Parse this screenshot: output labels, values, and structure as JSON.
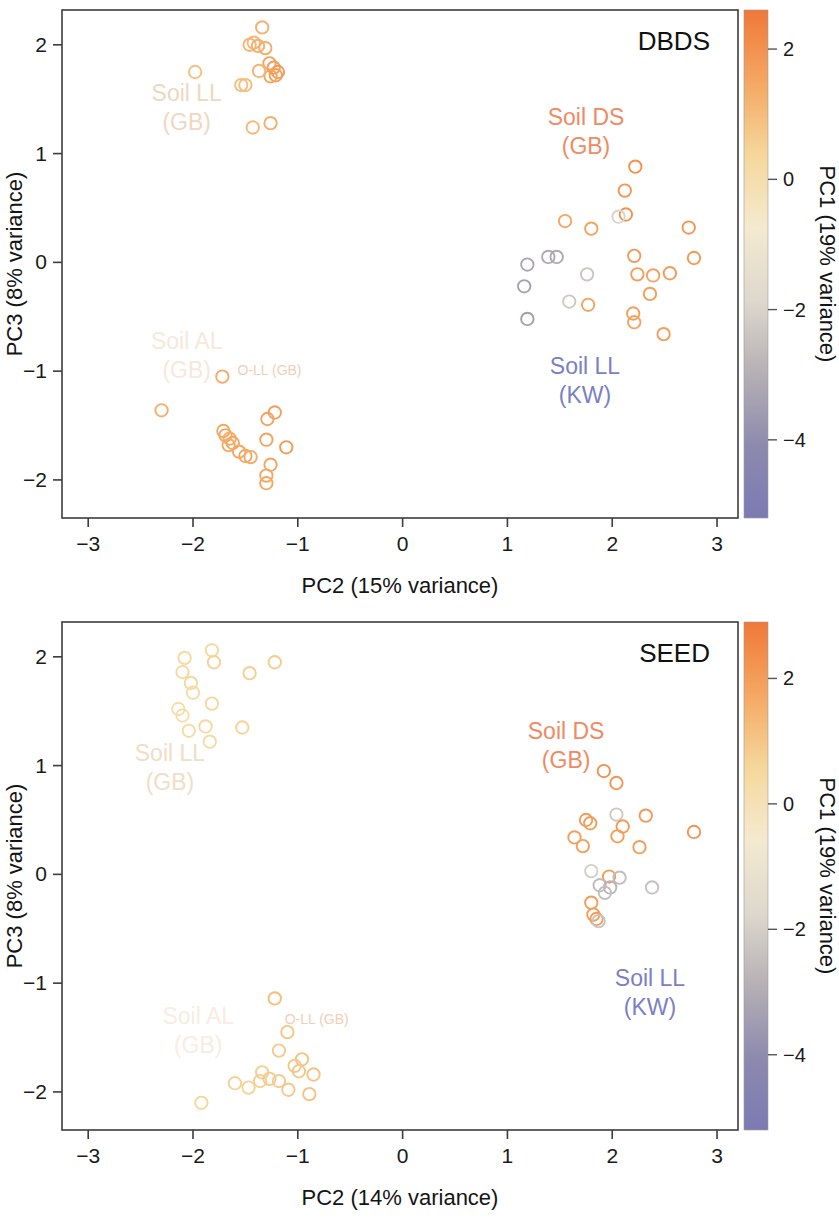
{
  "figure": {
    "kind": "pca-scatter-two-panel",
    "panels": [
      "DBDS",
      "SEED"
    ]
  },
  "panels": [
    {
      "id": "dbds",
      "title": "DBDS",
      "xlabel": "PC2 (15% variance)",
      "ylabel": "PC3 (8% variance)",
      "colorbar_label": "PC1 (19% variance)",
      "annotations": [
        {
          "name": "soil-ll-gb",
          "lines": [
            "Soil LL",
            "(GB)"
          ],
          "x": -2.06,
          "y": 1.48,
          "color": "#f0d7bf",
          "size": "normal"
        },
        {
          "name": "soil-al-gb",
          "lines": [
            "Soil AL",
            "(GB)"
          ],
          "x": -2.06,
          "y": -0.8,
          "color": "#f7e8da",
          "size": "normal"
        },
        {
          "name": "o-ll-gb",
          "lines": [
            "O-LL (GB)"
          ],
          "x": -1.27,
          "y": -1.04,
          "color": "#f3cdb6",
          "size": "small"
        },
        {
          "name": "soil-ds-gb",
          "lines": [
            "Soil DS",
            "(GB)"
          ],
          "x": 1.75,
          "y": 1.26,
          "color": "#f08a62",
          "size": "normal"
        },
        {
          "name": "soil-ll-kw",
          "lines": [
            "Soil LL",
            "(KW)"
          ],
          "x": 1.74,
          "y": -1.03,
          "color": "#7b7fc4",
          "size": "normal"
        }
      ]
    },
    {
      "id": "seed",
      "title": "SEED",
      "xlabel": "PC2 (14% variance)",
      "ylabel": "PC3 (8% variance)",
      "colorbar_label": "PC1 (19% variance)",
      "annotations": [
        {
          "name": "soil-ll-gb",
          "lines": [
            "Soil LL",
            "(GB)"
          ],
          "x": -2.22,
          "y": 1.04,
          "color": "#f2ddc6",
          "size": "normal"
        },
        {
          "name": "soil-al-gb",
          "lines": [
            "Soil AL",
            "(GB)"
          ],
          "x": -1.95,
          "y": -1.38,
          "color": "#f9ece0",
          "size": "normal"
        },
        {
          "name": "o-ll-gb",
          "lines": [
            "O-LL (GB)"
          ],
          "x": -0.82,
          "y": -1.38,
          "color": "#f3cdb6",
          "size": "small"
        },
        {
          "name": "soil-ds-gb",
          "lines": [
            "Soil DS",
            "(GB)"
          ],
          "x": 1.56,
          "y": 1.24,
          "color": "#f08a62",
          "size": "normal"
        },
        {
          "name": "soil-ll-kw",
          "lines": [
            "Soil LL",
            "(KW)"
          ],
          "x": 2.36,
          "y": -1.03,
          "color": "#7b7fc4",
          "size": "normal"
        }
      ]
    }
  ],
  "chart_data": [
    {
      "type": "scatter",
      "title": "DBDS",
      "xlabel": "PC2 (15% variance)",
      "ylabel": "PC3 (8% variance)",
      "xlim": [
        -3.25,
        3.2
      ],
      "ylim": [
        -2.35,
        2.32
      ],
      "xticks": [
        -3,
        -2,
        -1,
        0,
        1,
        2,
        3
      ],
      "yticks": [
        -2,
        -1,
        0,
        1,
        2
      ],
      "grid": false,
      "marker": "open-circle",
      "colorbar": {
        "label": "PC1 (19% variance)",
        "ticks": [
          2,
          0,
          -2,
          -4
        ],
        "vmin": -5.2,
        "vmax": 2.6,
        "colors": [
          "#f07838",
          "#f4a863",
          "#f6d79b",
          "#f4ead0",
          "#ded8cd",
          "#b6b0b5",
          "#8d8aae",
          "#7b7ab4"
        ]
      },
      "points": [
        {
          "x": -1.34,
          "y": 2.16,
          "c": 1.3
        },
        {
          "x": -1.42,
          "y": 2.02,
          "c": 1.1
        },
        {
          "x": -1.46,
          "y": 2.0,
          "c": 1.2
        },
        {
          "x": -1.38,
          "y": 1.99,
          "c": 1.3
        },
        {
          "x": -1.31,
          "y": 1.97,
          "c": 1.4
        },
        {
          "x": -1.27,
          "y": 1.83,
          "c": 1.6
        },
        {
          "x": -1.23,
          "y": 1.79,
          "c": 1.7
        },
        {
          "x": -1.19,
          "y": 1.75,
          "c": 1.8
        },
        {
          "x": -1.21,
          "y": 1.72,
          "c": 1.7
        },
        {
          "x": -1.26,
          "y": 1.71,
          "c": 1.5
        },
        {
          "x": -1.37,
          "y": 1.76,
          "c": 1.2
        },
        {
          "x": -1.98,
          "y": 1.75,
          "c": 0.9
        },
        {
          "x": -1.54,
          "y": 1.63,
          "c": 1.0
        },
        {
          "x": -1.5,
          "y": 1.63,
          "c": 1.0
        },
        {
          "x": -1.43,
          "y": 1.24,
          "c": 1.1
        },
        {
          "x": -1.26,
          "y": 1.28,
          "c": 1.3
        },
        {
          "x": -1.72,
          "y": -1.05,
          "c": 1.4
        },
        {
          "x": -2.3,
          "y": -1.36,
          "c": 1.3
        },
        {
          "x": -1.71,
          "y": -1.55,
          "c": 1.5
        },
        {
          "x": -1.69,
          "y": -1.59,
          "c": 1.5
        },
        {
          "x": -1.65,
          "y": -1.62,
          "c": 1.4
        },
        {
          "x": -1.62,
          "y": -1.66,
          "c": 1.5
        },
        {
          "x": -1.66,
          "y": -1.68,
          "c": 1.4
        },
        {
          "x": -1.56,
          "y": -1.74,
          "c": 1.5
        },
        {
          "x": -1.5,
          "y": -1.78,
          "c": 1.5
        },
        {
          "x": -1.45,
          "y": -1.79,
          "c": 1.4
        },
        {
          "x": -1.29,
          "y": -1.44,
          "c": 1.6
        },
        {
          "x": -1.22,
          "y": -1.38,
          "c": 1.7
        },
        {
          "x": -1.3,
          "y": -1.63,
          "c": 1.6
        },
        {
          "x": -1.11,
          "y": -1.7,
          "c": 1.8
        },
        {
          "x": -1.26,
          "y": -1.86,
          "c": 1.6
        },
        {
          "x": -1.3,
          "y": -1.96,
          "c": 1.5
        },
        {
          "x": -1.3,
          "y": -2.03,
          "c": 1.5
        },
        {
          "x": 2.22,
          "y": 0.88,
          "c": 2.0
        },
        {
          "x": 2.12,
          "y": 0.66,
          "c": 1.9
        },
        {
          "x": 2.13,
          "y": 0.44,
          "c": 2.0
        },
        {
          "x": 2.06,
          "y": 0.42,
          "c": -2.0
        },
        {
          "x": 1.55,
          "y": 0.38,
          "c": 1.5
        },
        {
          "x": 1.8,
          "y": 0.31,
          "c": 1.6
        },
        {
          "x": 2.73,
          "y": 0.32,
          "c": 1.9
        },
        {
          "x": 1.19,
          "y": -0.02,
          "c": -3.3
        },
        {
          "x": 1.39,
          "y": 0.05,
          "c": -3.2
        },
        {
          "x": 1.47,
          "y": 0.05,
          "c": -3.2
        },
        {
          "x": 2.21,
          "y": 0.06,
          "c": 1.8
        },
        {
          "x": 2.78,
          "y": 0.04,
          "c": 1.8
        },
        {
          "x": 1.16,
          "y": -0.22,
          "c": -3.4
        },
        {
          "x": 1.76,
          "y": -0.11,
          "c": -2.4
        },
        {
          "x": 2.24,
          "y": -0.11,
          "c": 1.7
        },
        {
          "x": 2.39,
          "y": -0.12,
          "c": 1.6
        },
        {
          "x": 2.55,
          "y": -0.1,
          "c": 1.8
        },
        {
          "x": 1.59,
          "y": -0.36,
          "c": -2.3
        },
        {
          "x": 1.77,
          "y": -0.39,
          "c": 1.6
        },
        {
          "x": 2.36,
          "y": -0.29,
          "c": 1.7
        },
        {
          "x": 1.19,
          "y": -0.52,
          "c": -3.5
        },
        {
          "x": 2.2,
          "y": -0.47,
          "c": 1.7
        },
        {
          "x": 2.21,
          "y": -0.55,
          "c": 1.6
        },
        {
          "x": 2.49,
          "y": -0.66,
          "c": 1.7
        }
      ]
    },
    {
      "type": "scatter",
      "title": "SEED",
      "xlabel": "PC2 (14% variance)",
      "ylabel": "PC3 (8% variance)",
      "xlim": [
        -3.25,
        3.2
      ],
      "ylim": [
        -2.35,
        2.32
      ],
      "xticks": [
        -3,
        -2,
        -1,
        0,
        1,
        2,
        3
      ],
      "yticks": [
        -2,
        -1,
        0,
        1,
        2
      ],
      "grid": false,
      "marker": "open-circle",
      "colorbar": {
        "label": "PC1 (19% variance)",
        "ticks": [
          2,
          0,
          -2,
          -4
        ],
        "vmin": -5.2,
        "vmax": 2.9,
        "colors": [
          "#f07838",
          "#f4a863",
          "#f6d79b",
          "#f4ead0",
          "#ded8cd",
          "#b6b0b5",
          "#8d8aae",
          "#7b7ab4"
        ]
      },
      "points": [
        {
          "x": -1.82,
          "y": 2.06,
          "c": 0.6
        },
        {
          "x": -2.08,
          "y": 1.99,
          "c": 0.5
        },
        {
          "x": -1.8,
          "y": 1.95,
          "c": 0.7
        },
        {
          "x": -1.22,
          "y": 1.95,
          "c": 0.9
        },
        {
          "x": -2.1,
          "y": 1.86,
          "c": 0.5
        },
        {
          "x": -1.46,
          "y": 1.85,
          "c": 0.8
        },
        {
          "x": -2.02,
          "y": 1.76,
          "c": 0.5
        },
        {
          "x": -2.0,
          "y": 1.67,
          "c": 0.4
        },
        {
          "x": -2.14,
          "y": 1.52,
          "c": 0.3
        },
        {
          "x": -2.1,
          "y": 1.46,
          "c": 0.3
        },
        {
          "x": -1.82,
          "y": 1.57,
          "c": 0.6
        },
        {
          "x": -2.04,
          "y": 1.32,
          "c": 0.4
        },
        {
          "x": -1.88,
          "y": 1.36,
          "c": 0.5
        },
        {
          "x": -1.53,
          "y": 1.35,
          "c": 0.7
        },
        {
          "x": -1.84,
          "y": 1.22,
          "c": 0.4
        },
        {
          "x": -1.22,
          "y": -1.14,
          "c": 1.2
        },
        {
          "x": -1.1,
          "y": -1.45,
          "c": 1.0
        },
        {
          "x": -1.18,
          "y": -1.62,
          "c": 0.9
        },
        {
          "x": -0.96,
          "y": -1.7,
          "c": 1.1
        },
        {
          "x": -1.03,
          "y": -1.76,
          "c": 1.0
        },
        {
          "x": -0.99,
          "y": -1.81,
          "c": 1.0
        },
        {
          "x": -1.34,
          "y": -1.82,
          "c": 0.8
        },
        {
          "x": -0.85,
          "y": -1.84,
          "c": 1.1
        },
        {
          "x": -1.36,
          "y": -1.9,
          "c": 0.8
        },
        {
          "x": -1.27,
          "y": -1.88,
          "c": 0.9
        },
        {
          "x": -1.18,
          "y": -1.9,
          "c": 0.9
        },
        {
          "x": -1.6,
          "y": -1.92,
          "c": 0.7
        },
        {
          "x": -1.47,
          "y": -1.96,
          "c": 0.7
        },
        {
          "x": -1.09,
          "y": -1.98,
          "c": 1.0
        },
        {
          "x": -0.89,
          "y": -2.02,
          "c": 1.1
        },
        {
          "x": -1.92,
          "y": -2.1,
          "c": 0.6
        },
        {
          "x": 1.92,
          "y": 0.95,
          "c": 2.3
        },
        {
          "x": 2.04,
          "y": 0.84,
          "c": 2.2
        },
        {
          "x": 2.04,
          "y": 0.55,
          "c": -2.2
        },
        {
          "x": 1.75,
          "y": 0.5,
          "c": 2.0
        },
        {
          "x": 2.32,
          "y": 0.54,
          "c": 2.1
        },
        {
          "x": 1.79,
          "y": 0.47,
          "c": 2.0
        },
        {
          "x": 2.1,
          "y": 0.44,
          "c": 2.1
        },
        {
          "x": 1.64,
          "y": 0.34,
          "c": 1.9
        },
        {
          "x": 2.05,
          "y": 0.35,
          "c": 2.0
        },
        {
          "x": 1.72,
          "y": 0.26,
          "c": 1.9
        },
        {
          "x": 2.26,
          "y": 0.25,
          "c": 2.0
        },
        {
          "x": 2.78,
          "y": 0.39,
          "c": 2.2
        },
        {
          "x": 1.8,
          "y": 0.03,
          "c": -2.0
        },
        {
          "x": 1.97,
          "y": -0.02,
          "c": 2.0
        },
        {
          "x": 2.07,
          "y": -0.03,
          "c": -2.5
        },
        {
          "x": 1.88,
          "y": -0.1,
          "c": -2.6
        },
        {
          "x": 1.98,
          "y": -0.12,
          "c": -2.7
        },
        {
          "x": 1.93,
          "y": -0.17,
          "c": -2.5
        },
        {
          "x": 2.38,
          "y": -0.12,
          "c": -2.4
        },
        {
          "x": 1.8,
          "y": -0.26,
          "c": 2.0
        },
        {
          "x": 1.82,
          "y": -0.37,
          "c": 2.0
        },
        {
          "x": 1.85,
          "y": -0.41,
          "c": 2.0
        },
        {
          "x": 1.87,
          "y": -0.43,
          "c": -2.3
        }
      ]
    }
  ]
}
